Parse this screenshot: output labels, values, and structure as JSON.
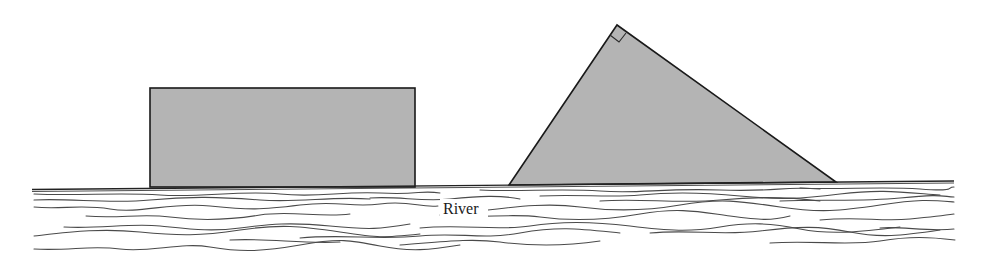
{
  "figure": {
    "labels": {
      "river": "River"
    },
    "shapes": {
      "rectangle": {
        "x": 150,
        "y": 88,
        "width": 265,
        "height": 99
      },
      "triangle": {
        "left_base": [
          509,
          185
        ],
        "apex": [
          617,
          25
        ],
        "right_base": [
          836,
          182
        ],
        "right_angle_at": "apex"
      }
    },
    "colors": {
      "shape_fill": "#b4b4b4",
      "outline": "#1a1a1a",
      "water_lines": "#4a4a4a",
      "background": "#ffffff"
    }
  }
}
